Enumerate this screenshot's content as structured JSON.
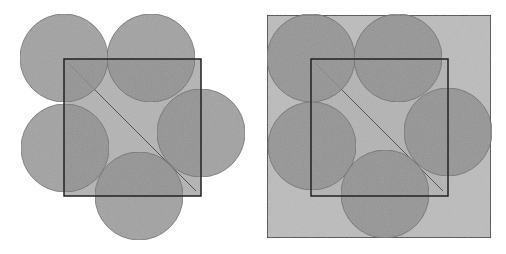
{
  "figures": [
    {
      "id": "left",
      "square": {
        "x": 64,
        "y": 59,
        "size": 137
      },
      "diagonal": {
        "x1": 68,
        "y1": 63,
        "x2": 196,
        "y2": 191
      },
      "circles": [
        {
          "name": "top-left",
          "cx": 64,
          "cy": 58,
          "r": 44
        },
        {
          "name": "top-right",
          "cx": 151,
          "cy": 58,
          "r": 44
        },
        {
          "name": "right",
          "cx": 201,
          "cy": 133,
          "r": 44
        },
        {
          "name": "left",
          "cx": 65,
          "cy": 148,
          "r": 44
        },
        {
          "name": "bottom",
          "cx": 139,
          "cy": 196,
          "r": 44
        }
      ]
    },
    {
      "id": "right",
      "outer_square": {
        "x": 267,
        "y": 15,
        "w": 224,
        "h": 223
      },
      "square": {
        "x": 311,
        "y": 59,
        "size": 137
      },
      "diagonal": {
        "x1": 315,
        "y1": 63,
        "x2": 443,
        "y2": 191
      },
      "circles": [
        {
          "name": "top-left",
          "cx": 311,
          "cy": 58,
          "r": 44
        },
        {
          "name": "top-right",
          "cx": 398,
          "cy": 58,
          "r": 44
        },
        {
          "name": "right",
          "cx": 448,
          "cy": 132,
          "r": 44
        },
        {
          "name": "left",
          "cx": 312,
          "cy": 146,
          "r": 44
        },
        {
          "name": "bottom",
          "cx": 385,
          "cy": 194,
          "r": 44
        }
      ]
    }
  ],
  "colors": {
    "background": "#ffffff",
    "circle_fill": "#8e8e8e",
    "circle_stroke": "#6a6a6a",
    "square_fill": "#b4b4b4",
    "outer_fill": "#bcbcbc",
    "line": "#222222"
  }
}
